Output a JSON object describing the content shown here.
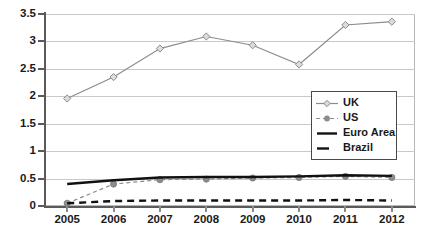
{
  "chart_data": {
    "type": "line",
    "title": "",
    "subtitle": "",
    "xlabel": "",
    "ylabel": "",
    "categories": [
      "2005",
      "2006",
      "2007",
      "2008",
      "2009",
      "2010",
      "2011",
      "2012"
    ],
    "x": [
      2005,
      2006,
      2007,
      2008,
      2009,
      2010,
      2011,
      2012
    ],
    "ylim": [
      0,
      3.5
    ],
    "ytick_labels": [
      "0",
      "0.5",
      "1",
      "1.5",
      "2",
      "2.5",
      "3",
      "3.5"
    ],
    "yticks": [
      0,
      0.5,
      1,
      1.5,
      2,
      2.5,
      3,
      3.5
    ],
    "grid": "horizontal",
    "legend_position": "inside-center-right",
    "series": [
      {
        "name": "UK",
        "color": "#8c8c8c",
        "marker": "diamond-open",
        "line_style": "solid",
        "values": [
          1.96,
          2.35,
          2.87,
          3.09,
          2.93,
          2.58,
          3.3,
          3.36
        ]
      },
      {
        "name": "US",
        "color": "#8c8c8c",
        "marker": "circle-filled",
        "line_style": "dashed",
        "values": [
          0.05,
          0.4,
          0.48,
          0.49,
          0.51,
          0.52,
          0.54,
          0.52
        ]
      },
      {
        "name": "Euro Area",
        "color": "#111111",
        "marker": "none",
        "line_style": "solid-thick",
        "values": [
          0.4,
          0.47,
          0.52,
          0.53,
          0.53,
          0.54,
          0.56,
          0.55
        ]
      },
      {
        "name": "Brazil",
        "color": "#111111",
        "marker": "none",
        "line_style": "dashed-thick",
        "values": [
          0.05,
          0.09,
          0.1,
          0.1,
          0.1,
          0.1,
          0.11,
          0.1
        ]
      }
    ]
  },
  "legend": {
    "items": [
      {
        "label": "UK"
      },
      {
        "label": "US"
      },
      {
        "label": "Euro Area"
      },
      {
        "label": "Brazil"
      }
    ]
  }
}
